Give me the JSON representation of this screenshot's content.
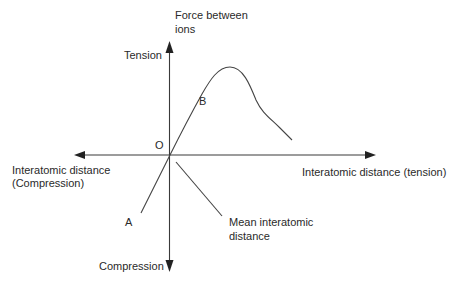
{
  "diagram": {
    "type": "force-vs-interatomic-distance",
    "labels": {
      "y_axis_title_line1": "Force between",
      "y_axis_title_line2": "ions",
      "y_positive": "Tension",
      "y_negative": "Compression",
      "x_positive": "Interatomic distance (tension)",
      "x_negative_line1": "Interatomic distance",
      "x_negative_line2": "(Compression)",
      "origin": "O",
      "point_a": "A",
      "point_b": "B",
      "mean_distance_line1": "Mean interatomic",
      "mean_distance_line2": "distance"
    },
    "colors": {
      "line": "#3a3a3a",
      "text": "#2a2a2a",
      "background": "#ffffff"
    }
  }
}
